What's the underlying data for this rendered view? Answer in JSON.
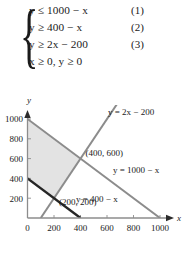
{
  "system": {
    "brace": "{",
    "equations": [
      {
        "text": "y ≤ 1000 − x",
        "number": "(1)"
      },
      {
        "text": "y ≥ 400 − x",
        "number": "(2)"
      },
      {
        "text": "y ≥ 2x − 200",
        "number": "(3)"
      },
      {
        "text": "x ≥ 0, y ≥ 0",
        "number": ""
      }
    ]
  },
  "chart_data": {
    "type": "line",
    "title": "",
    "xlabel": "x",
    "ylabel": "y",
    "xlim": [
      0,
      1100
    ],
    "ylim": [
      0,
      1100
    ],
    "xticks": [
      0,
      200,
      400,
      600,
      800,
      1000
    ],
    "xticklabels": [
      "0",
      "200",
      "400",
      "600",
      "800",
      "1000"
    ],
    "yticks": [
      200,
      400,
      600,
      800,
      1000
    ],
    "yticklabels": [
      "200",
      "400",
      "600",
      "800",
      "1000"
    ],
    "grid": false,
    "legend": "none",
    "series": [
      {
        "name": "y = 1000 - x",
        "label": "y = 1000 − x",
        "color": "#8c8c8c",
        "width": 2,
        "x": [
          0,
          1000
        ],
        "y": [
          1000,
          0
        ]
      },
      {
        "name": "y = 2x - 200",
        "label": "y = 2x − 200",
        "color": "#8c8c8c",
        "width": 2,
        "x": [
          100,
          680
        ],
        "y": [
          0,
          1160
        ]
      },
      {
        "name": "y = 400 - x",
        "label": "y = 400 − x",
        "color": "#262626",
        "width": 2.4,
        "x": [
          0,
          400
        ],
        "y": [
          400,
          0
        ]
      }
    ],
    "shaded_region": {
      "name": "feasible-region",
      "fill": "#e3e3e3",
      "vertices": [
        [
          0,
          1000
        ],
        [
          400,
          600
        ],
        [
          200,
          200
        ],
        [
          0,
          400
        ]
      ]
    },
    "annotations": [
      {
        "name": "vertex-400-600",
        "text": "(400, 600)",
        "x": 400,
        "y": 600
      },
      {
        "name": "vertex-200-200",
        "text": "(200, 200)",
        "x": 200,
        "y": 200
      }
    ],
    "axis_color": "#8c8c8c"
  }
}
